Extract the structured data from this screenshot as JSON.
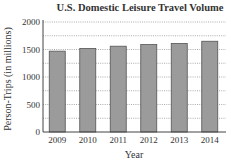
{
  "chart_data": {
    "type": "bar",
    "title": "U.S. Domestic Leisure Travel Volume",
    "xlabel": "Year",
    "ylabel": "Person-Trips (in millions)",
    "categories": [
      "2009",
      "2010",
      "2011",
      "2012",
      "2013",
      "2014"
    ],
    "values": [
      1470,
      1520,
      1560,
      1590,
      1610,
      1650
    ],
    "ylim": [
      0,
      2000
    ],
    "yticks": [
      0,
      500,
      1000,
      1500,
      2000
    ],
    "ytick_labels": [
      "0",
      "500",
      "1000",
      "1500",
      "2000"
    ],
    "grid_step": 250,
    "grid": true,
    "colors": {
      "bar_fill": "#9b9b9b",
      "bar_stroke": "#555555",
      "grid": "#888888"
    }
  }
}
